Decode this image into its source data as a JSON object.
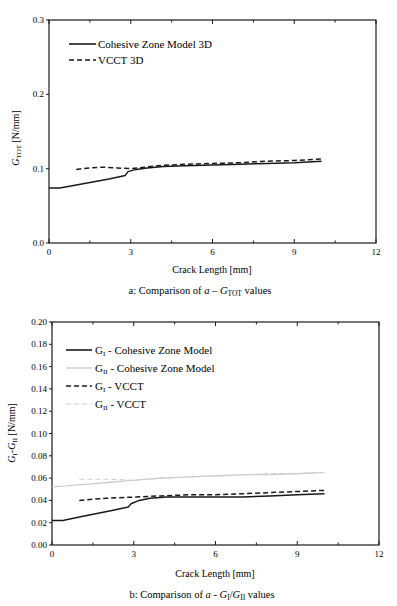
{
  "chart_data": [
    {
      "id": "a",
      "type": "line",
      "caption_prefix": "a: Comparison of ",
      "caption_var": "a",
      "caption_dash": " – ",
      "caption_g": "G",
      "caption_sub": "TOT",
      "caption_suffix": " values",
      "xlabel": "Crack Length [mm]",
      "ylabel_main": "G",
      "ylabel_sub": "TOT",
      "ylabel_unit": " [N/mm]",
      "xlim": [
        0,
        12
      ],
      "ylim": [
        0,
        0.3
      ],
      "xticks": [
        0,
        3,
        6,
        9,
        12
      ],
      "xtick_labels": [
        "0",
        "3",
        "6",
        "9",
        "12"
      ],
      "yticks": [
        0.0,
        0.1,
        0.2,
        0.3
      ],
      "ytick_labels": [
        "0.0",
        "0.1",
        "0.2",
        "0.3"
      ],
      "grid": false,
      "legend_position": "top-left",
      "series": [
        {
          "name": "Cohesive Zone Model 3D",
          "style": "solid",
          "color": "#1a1a1a",
          "x": [
            0,
            0.4,
            1.0,
            1.6,
            2.2,
            2.8,
            2.9,
            3.2,
            3.6,
            4.2,
            5.0,
            6.0,
            7.0,
            8.0,
            9.0,
            10.0
          ],
          "y": [
            0.074,
            0.074,
            0.078,
            0.082,
            0.086,
            0.091,
            0.096,
            0.099,
            0.101,
            0.103,
            0.104,
            0.105,
            0.106,
            0.107,
            0.108,
            0.11
          ]
        },
        {
          "name": "VCCT 3D",
          "style": "dashed",
          "color": "#1a1a1a",
          "x": [
            1.0,
            1.5,
            2.0,
            2.5,
            3.0,
            3.5,
            4.0,
            5.0,
            6.0,
            7.0,
            8.0,
            9.0,
            10.0
          ],
          "y": [
            0.099,
            0.101,
            0.102,
            0.101,
            0.1,
            0.102,
            0.104,
            0.106,
            0.107,
            0.108,
            0.11,
            0.111,
            0.113
          ]
        }
      ]
    },
    {
      "id": "b",
      "type": "line",
      "caption_prefix": "b: Comparison of ",
      "caption_var": "a",
      "caption_dash": " - ",
      "caption_g1": "G",
      "caption_sub1": "I",
      "caption_slash": "/",
      "caption_g2": "G",
      "caption_sub2": "II",
      "caption_suffix": " values",
      "xlabel": "Crack Length [mm]",
      "ylabel_g1": "G",
      "ylabel_sub1": "I",
      "ylabel_dash": "-",
      "ylabel_g2": "G",
      "ylabel_sub2": "II",
      "ylabel_unit": " [N/mm]",
      "xlim": [
        0,
        12
      ],
      "ylim": [
        0,
        0.2
      ],
      "xticks": [
        0,
        3,
        6,
        9,
        12
      ],
      "xtick_labels": [
        "0",
        "3",
        "6",
        "9",
        "12"
      ],
      "yticks": [
        0.0,
        0.02,
        0.04,
        0.06,
        0.08,
        0.1,
        0.12,
        0.14,
        0.16,
        0.18,
        0.2
      ],
      "ytick_labels": [
        "0.00",
        "0.02",
        "0.04",
        "0.06",
        "0.08",
        "0.10",
        "0.12",
        "0.14",
        "0.16",
        "0.18",
        "0.20"
      ],
      "grid": false,
      "legend_position": "top-left",
      "series": [
        {
          "name_g": "G",
          "name_sub": "I",
          "name_rest": " - Cohesive Zone Model",
          "style": "solid",
          "color": "#1a1a1a",
          "x": [
            0,
            0.4,
            1.0,
            1.6,
            2.2,
            2.8,
            2.9,
            3.2,
            3.6,
            4.2,
            5.0,
            6.0,
            7.0,
            8.0,
            9.0,
            10.0
          ],
          "y": [
            0.022,
            0.022,
            0.025,
            0.028,
            0.031,
            0.034,
            0.037,
            0.04,
            0.042,
            0.043,
            0.043,
            0.043,
            0.043,
            0.044,
            0.045,
            0.046
          ]
        },
        {
          "name_g": "G",
          "name_sub": "II",
          "name_rest": " - Cohesive Zone Model",
          "style": "solid",
          "color": "#c4c4c4",
          "x": [
            0,
            1.0,
            2.0,
            3.0,
            4.0,
            5.0,
            6.0,
            7.0,
            8.0,
            9.0,
            10.0
          ],
          "y": [
            0.052,
            0.054,
            0.056,
            0.058,
            0.06,
            0.061,
            0.062,
            0.063,
            0.063,
            0.064,
            0.065
          ]
        },
        {
          "name_g": "G",
          "name_sub": "I",
          "name_rest": " - VCCT",
          "style": "dashed",
          "color": "#1a1a1a",
          "x": [
            1.0,
            2.0,
            3.0,
            4.0,
            5.0,
            6.0,
            7.0,
            8.0,
            9.0,
            10.0
          ],
          "y": [
            0.04,
            0.042,
            0.043,
            0.044,
            0.045,
            0.045,
            0.046,
            0.047,
            0.048,
            0.049
          ]
        },
        {
          "name_g": "G",
          "name_sub": "II",
          "name_rest": " - VCCT",
          "style": "dashed",
          "color": "#cfcfcf",
          "x": [
            1.0,
            2.0,
            3.0,
            4.0,
            5.0,
            6.0,
            7.0,
            8.0,
            9.0,
            10.0
          ],
          "y": [
            0.059,
            0.059,
            0.058,
            0.06,
            0.061,
            0.062,
            0.063,
            0.064,
            0.064,
            0.065
          ]
        }
      ]
    }
  ]
}
